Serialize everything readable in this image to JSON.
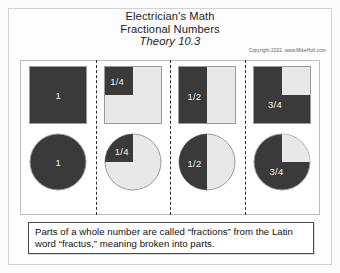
{
  "slide": {
    "title_line1": "Electrician's Math",
    "title_line2": "Fractional Numbers",
    "subtitle": "Theory 10.3",
    "copyright": "Copyright 2022, www.MikeHolt.com",
    "caption": "Parts of a whole number are called “fractions” from the Latin word “fractus,” meaning broken into parts."
  },
  "colors": {
    "filled": "#3a3a3a",
    "empty": "#e8e8e8",
    "label_text": "#ffffff",
    "panel_border": "#bdbdbd",
    "divider": "#2b2b2b"
  },
  "columns": [
    {
      "label": "1",
      "fraction_value": 1,
      "square_fill": "full",
      "circle_fill": "full",
      "square_label": "1",
      "circle_label": "1"
    },
    {
      "label": "1/4",
      "fraction_value": 0.25,
      "square_fill": "quarter-top-left",
      "circle_fill": "quarter-upper-left",
      "square_label": "1/4",
      "circle_label": "1/4"
    },
    {
      "label": "1/2",
      "fraction_value": 0.5,
      "square_fill": "half-left",
      "circle_fill": "half-left",
      "square_label": "1/2",
      "circle_label": "1/2"
    },
    {
      "label": "3/4",
      "fraction_value": 0.75,
      "square_fill": "three-quarter-notch-top-right",
      "circle_fill": "three-quarter-notch-upper-right",
      "square_label": "3/4",
      "circle_label": "3/4"
    }
  ]
}
